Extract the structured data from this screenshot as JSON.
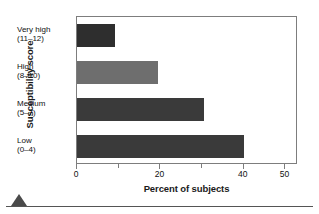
{
  "chart_data": {
    "type": "bar",
    "orientation": "horizontal",
    "title": "",
    "xlabel": "Percent of subjects",
    "ylabel": "Susceptibility score",
    "categories": [
      "Very high (11–12)",
      "High (8–10)",
      "Medium (5–7)",
      "Low (0–4)"
    ],
    "category_lines": [
      {
        "line1": "Very high",
        "line2": "(11–12)"
      },
      {
        "line1": "High",
        "line2": "(8–10)"
      },
      {
        "line1": "Medium",
        "line2": "(5–7)"
      },
      {
        "line1": "Low",
        "line2": "(0–4)"
      }
    ],
    "values": [
      9,
      19.5,
      30.5,
      40
    ],
    "bar_colors": [
      "#2e2e2e",
      "#6e6e6e",
      "#3a3a3a",
      "#3a3a3a"
    ],
    "xlim": [
      0,
      53
    ],
    "xticks": [
      0,
      10,
      20,
      30,
      40,
      50
    ],
    "xtick_labels": [
      "0",
      "",
      "20",
      "",
      "40",
      "50"
    ],
    "xtick_labeled": [
      0,
      20,
      40,
      50
    ],
    "grid": false,
    "legend": null,
    "frame_color": "#7d7d7d",
    "background": "#ffffff"
  },
  "footer": {
    "marker_icon": "triangle-up-icon",
    "rule_color": "#555555"
  }
}
